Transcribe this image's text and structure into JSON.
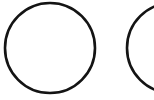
{
  "canvas": {
    "width": 154,
    "height": 100,
    "background_color": "#ffffff",
    "title": "Two Circles"
  },
  "style": {
    "stroke_color": "#141414",
    "stroke_width": 2.6,
    "fill": "none"
  },
  "shapes": [
    {
      "name": "circle-left",
      "type": "circle",
      "cx": 50,
      "cy": 48,
      "r": 45,
      "stroke_color": "#141414",
      "stroke_width": 2.6,
      "clipped": "top"
    },
    {
      "name": "circle-right",
      "type": "circle",
      "cx": 172,
      "cy": 48,
      "r": 45,
      "stroke_color": "#141414",
      "stroke_width": 2.6,
      "clipped": "right"
    }
  ],
  "chart_data": {
    "type": "scatter",
    "xlabel": "",
    "ylabel": "",
    "xlim": [
      0,
      154
    ],
    "ylim": [
      0,
      100
    ],
    "grid": false,
    "legend": "none",
    "categories": [
      "circle-left",
      "circle-right"
    ],
    "series": [
      {
        "name": "circle-centers-x",
        "values": [
          50,
          172
        ]
      },
      {
        "name": "circle-centers-y",
        "values": [
          48,
          48
        ]
      },
      {
        "name": "circle-radii",
        "values": [
          45,
          45
        ]
      }
    ],
    "annotations": []
  }
}
